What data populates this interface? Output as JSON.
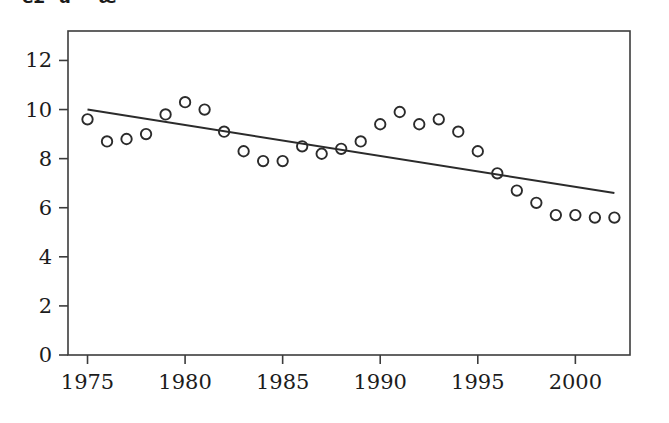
{
  "figure": {
    "title_partial": "é£åææ°",
    "background_color": "#ffffff",
    "frame_color": "#3c3c3c",
    "marker_color": "#2b2b2b",
    "line_color": "#2b2b2b"
  },
  "chart_data": {
    "type": "scatter",
    "title": "",
    "xlabel": "",
    "ylabel": "",
    "xlim": [
      1974.0,
      2002.8
    ],
    "ylim": [
      0,
      13.2
    ],
    "xticks": [
      1975,
      1980,
      1985,
      1990,
      1995,
      2000
    ],
    "yticks": [
      0,
      2,
      4,
      6,
      8,
      10,
      12
    ],
    "xtick_labels": [
      "1975",
      "1980",
      "1985",
      "1990",
      "1995",
      "2000"
    ],
    "ytick_labels": [
      "0",
      "2",
      "4",
      "6",
      "8",
      "10",
      "12"
    ],
    "grid": false,
    "legend": null,
    "marker_style": "open-circle",
    "x": [
      1975,
      1976,
      1977,
      1978,
      1979,
      1980,
      1981,
      1982,
      1983,
      1984,
      1985,
      1986,
      1987,
      1988,
      1989,
      1990,
      1991,
      1992,
      1993,
      1994,
      1995,
      1996,
      1997,
      1998,
      1999,
      2000,
      2001,
      2002
    ],
    "values": [
      9.6,
      8.7,
      8.8,
      9.0,
      9.8,
      10.3,
      10.0,
      9.1,
      8.3,
      7.9,
      7.9,
      8.5,
      8.2,
      8.4,
      8.7,
      9.4,
      9.9,
      9.4,
      9.6,
      9.1,
      8.3,
      7.4,
      6.7,
      6.2,
      5.7,
      5.7,
      5.6,
      5.6
    ],
    "series": [
      {
        "name": "observed",
        "type": "scatter",
        "values": [
          9.6,
          8.7,
          8.8,
          9.0,
          9.8,
          10.3,
          10.0,
          9.1,
          8.3,
          7.9,
          7.9,
          8.5,
          8.2,
          8.4,
          8.7,
          9.4,
          9.9,
          9.4,
          9.6,
          9.1,
          8.3,
          7.4,
          6.7,
          6.2,
          5.7,
          5.7,
          5.6,
          5.6
        ]
      },
      {
        "name": "trend-line",
        "type": "line",
        "x_endpoints": [
          1975,
          2002
        ],
        "y_endpoints": [
          10.0,
          6.6
        ]
      }
    ]
  }
}
